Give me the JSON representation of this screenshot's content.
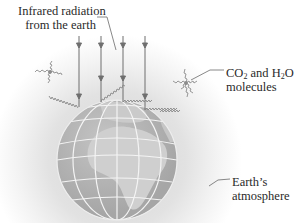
{
  "diagram": {
    "labels": {
      "infrared_line1": "Infrared radiation",
      "infrared_line2": "from the earth",
      "molecules_co2_prefix": "CO",
      "molecules_co2_sub": "2",
      "molecules_and": " and H",
      "molecules_h2o_sub": "2",
      "molecules_o": "O",
      "molecules_line2": "molecules",
      "atmosphere_line1": "Earth’s",
      "atmosphere_line2": "atmosphere"
    },
    "elements": {
      "globe": "earth-globe-with-grid",
      "vertical_arrows": 4,
      "wavy_rays": 5,
      "molecules": 2
    },
    "colors": {
      "background": "#ffffff",
      "atmosphere_haze": "#d9d9d9",
      "globe_fill": "#b3b3b3",
      "globe_land": "#c9c9c9",
      "grid_lines": "#f2f2f2",
      "arrows": "#6e6e6e",
      "text": "#2a2a2a"
    }
  }
}
